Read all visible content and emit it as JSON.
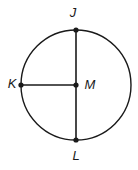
{
  "figure": {
    "type": "geometry-diagram",
    "shape": "circle",
    "background_color": "#ffffff",
    "stroke_color": "#1a1a1a",
    "canvas": {
      "width": 138,
      "height": 170
    },
    "circle": {
      "cx": 76,
      "cy": 85,
      "r": 55
    },
    "points": [
      {
        "id": "J",
        "label": "J",
        "x": 76,
        "y": 30,
        "label_x": 73,
        "label_y": 14,
        "anchor": "middle",
        "role": "top-endpoint-of-diameter"
      },
      {
        "id": "K",
        "label": "K",
        "x": 21,
        "y": 85,
        "label_x": 12,
        "label_y": 85,
        "anchor": "middle",
        "role": "left-endpoint-of-radius"
      },
      {
        "id": "M",
        "label": "M",
        "x": 76,
        "y": 85,
        "label_x": 90,
        "label_y": 86,
        "anchor": "middle",
        "role": "center"
      },
      {
        "id": "L",
        "label": "L",
        "x": 76,
        "y": 140,
        "label_x": 76,
        "label_y": 157,
        "anchor": "middle",
        "role": "bottom-endpoint-of-diameter"
      }
    ],
    "segments": [
      {
        "id": "JL",
        "name": "diameter-jl",
        "x1": 76,
        "y1": 30,
        "x2": 76,
        "y2": 140
      },
      {
        "id": "KM",
        "name": "radius-km",
        "x1": 21,
        "y1": 85,
        "x2": 76,
        "y2": 85
      }
    ],
    "dot_radius": 2.6
  }
}
